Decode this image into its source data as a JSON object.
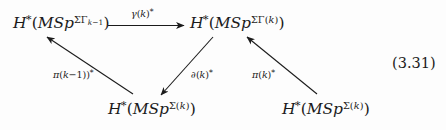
{
  "equation_number": "(3.31)",
  "diagram": {
    "type": "commutative-diagram",
    "ink_color": "#1b1b1b",
    "background_color": "#fdfdfd",
    "nodes": [
      {
        "id": "top-left",
        "label": "H*(MSp^{ΣΓ_{k-1}})",
        "parts": {
          "head": "H",
          "star": "*",
          "open": "(",
          "body": "MSp",
          "sup": "ΣΓ",
          "subsub": "k−1",
          "close": ")"
        }
      },
      {
        "id": "top-right",
        "label": "H*(MSp^{ΣΓ(k)})",
        "parts": {
          "head": "H",
          "star": "*",
          "open": "(",
          "body": "MSp",
          "sup": "ΣΓ(k)",
          "close": ")"
        }
      },
      {
        "id": "bottom-center",
        "label": "H*(MSp^{Σ(k)})",
        "parts": {
          "head": "H",
          "star": "*",
          "open": "(",
          "body": "MSp",
          "sup": "Σ(k)",
          "close": ")"
        }
      },
      {
        "id": "bottom-right",
        "label": "H*(MSp^{Σ(k)})",
        "parts": {
          "head": "H",
          "star": "*",
          "open": "(",
          "body": "MSp",
          "sup": "Σ(k)",
          "close": ")"
        }
      }
    ],
    "edges": [
      {
        "id": "gamma",
        "label": "γ(k)*",
        "from": "top-left",
        "to": "top-right",
        "style": "horizontal-right"
      },
      {
        "id": "pi-k-minus-1",
        "label": "π(k−1))*",
        "from": "bottom-center",
        "to": "top-left",
        "style": "diagonal-up-left"
      },
      {
        "id": "partial-k",
        "label": "∂(k)*",
        "from": "top-right",
        "to": "bottom-center",
        "style": "diagonal-down-left"
      },
      {
        "id": "pi-k",
        "label": "π(k)*",
        "from": "bottom-right",
        "to": "top-right",
        "style": "diagonal-up-left"
      }
    ]
  }
}
